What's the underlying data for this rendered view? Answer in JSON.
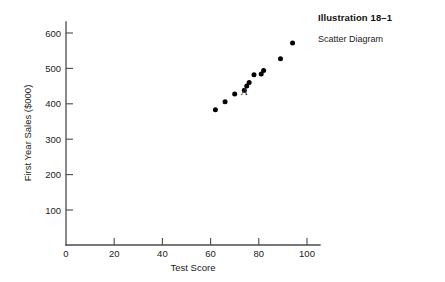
{
  "caption": {
    "title": "Illustration 18–1",
    "subtitle": "Scatter Diagram"
  },
  "chart_data": {
    "type": "scatter",
    "title": "",
    "xlabel": "Test Score",
    "ylabel": "First Year Sales ($000)",
    "xlim": [
      0,
      105
    ],
    "ylim": [
      0,
      640
    ],
    "xticks": [
      0,
      20,
      40,
      60,
      80,
      100
    ],
    "xtick_labels": [
      "0",
      "20",
      "40",
      "60",
      "80",
      "100"
    ],
    "yticks": [
      100,
      200,
      300,
      400,
      500,
      600
    ],
    "ytick_labels": [
      "100",
      "200",
      "300",
      "400",
      "500",
      "600"
    ],
    "grid": false,
    "legend": null,
    "marker": "filled-circle",
    "marker_color": "#000000",
    "points": [
      {
        "x": 62,
        "y": 383
      },
      {
        "x": 66,
        "y": 406
      },
      {
        "x": 70,
        "y": 428
      },
      {
        "x": 74,
        "y": 438
      },
      {
        "x": 75,
        "y": 450
      },
      {
        "x": 76,
        "y": 460
      },
      {
        "x": 78,
        "y": 482
      },
      {
        "x": 81,
        "y": 484
      },
      {
        "x": 82,
        "y": 494
      },
      {
        "x": 89,
        "y": 527
      },
      {
        "x": 94,
        "y": 572
      }
    ],
    "annotations": [
      {
        "text": "A",
        "x": 74,
        "y": 424
      }
    ]
  }
}
